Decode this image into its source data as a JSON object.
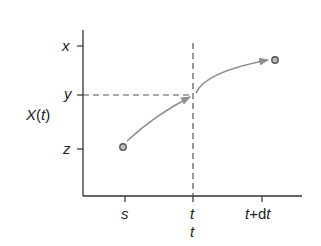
{
  "diagram": {
    "y_axis_label": {
      "main": "X",
      "open": "(",
      "var": "t",
      "close": ")"
    },
    "y_ticks": [
      {
        "label": "x",
        "y": 46
      },
      {
        "label": "y",
        "y": 95
      },
      {
        "label": "z",
        "y": 149
      }
    ],
    "x_ticks": [
      {
        "label": "s",
        "x": 125
      },
      {
        "label": "t",
        "x": 193
      },
      {
        "label_var": "t",
        "label_op": "+",
        "label_d": "d",
        "label_var2": "t",
        "x": 262
      }
    ],
    "x_secondary_label": "t",
    "points": {
      "start": {
        "x": 123,
        "y": 147
      },
      "end": {
        "x": 275,
        "y": 60
      }
    },
    "colors": {
      "axis": "#333333",
      "curve": "#8f8f8f",
      "dash": "#555555",
      "point_stroke": "#555555",
      "point_fill": "#bdbdbd"
    }
  }
}
